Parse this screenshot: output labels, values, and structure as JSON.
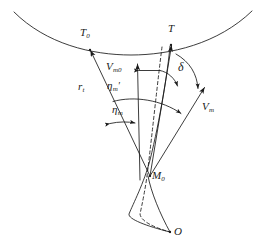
{
  "figure": {
    "type": "geometry-diagram",
    "domain": "missile-target-engagement-geometry",
    "background_color": "#ffffff",
    "stroke_color": "#1a1a1a",
    "labels": {
      "target_initial": {
        "text": "T",
        "sub": "0"
      },
      "target_current": {
        "text": "T",
        "sub": ""
      },
      "missile_velocity_initial": {
        "text": "V",
        "sub": "m0"
      },
      "missile_velocity": {
        "text": "V",
        "sub": "m"
      },
      "range_to_target": {
        "text": "r",
        "sub": "t"
      },
      "lead_angle_prime": {
        "text": "η",
        "sub": "m",
        "prime": "′"
      },
      "lead_angle": {
        "text": "η",
        "sub": "m"
      },
      "deviation_angle": {
        "text": "δ",
        "sub": ""
      },
      "missile_initial_position": {
        "text": "M",
        "sub": "0"
      },
      "origin_point": {
        "text": "O",
        "sub": ""
      }
    },
    "elements": [
      {
        "name": "target-path-arc",
        "kind": "curve",
        "interactable": false
      },
      {
        "name": "line-of-sight-initial",
        "kind": "arrow-line",
        "from": "M0",
        "to": "T0",
        "interactable": false
      },
      {
        "name": "line-of-sight-current",
        "kind": "arrow-line",
        "from": "M0",
        "to": "T",
        "interactable": false
      },
      {
        "name": "missile-velocity-vector",
        "kind": "arrow-line",
        "from": "M0",
        "to": "Vm",
        "interactable": false
      },
      {
        "name": "vertical-reference-axis",
        "kind": "arrow-line",
        "from": "M0",
        "to": "up",
        "interactable": false
      },
      {
        "name": "trajectory-dashed",
        "kind": "dashed-curve",
        "interactable": false
      },
      {
        "name": "trajectory-solid",
        "kind": "curve",
        "interactable": false
      },
      {
        "name": "angle-arc-outer",
        "kind": "arc",
        "label": "eta-m",
        "interactable": false
      },
      {
        "name": "angle-arc-inner",
        "kind": "arc",
        "label": "eta-m-prime",
        "interactable": false
      },
      {
        "name": "angle-arc-delta",
        "kind": "arc",
        "label": "delta",
        "interactable": false
      },
      {
        "name": "angle-arc-small-eta",
        "kind": "arc-double-arrow",
        "interactable": false
      }
    ]
  }
}
